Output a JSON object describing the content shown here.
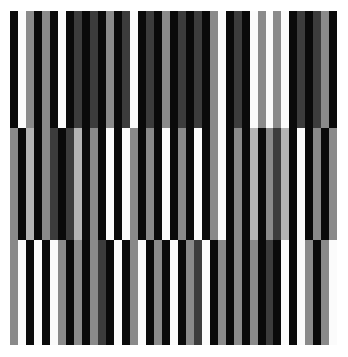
{
  "artwork": {
    "title": "Untitled Striped Composition",
    "medium": "geometric abstract op-art",
    "canvas": {
      "width_px": 348,
      "height_px": 357,
      "background_color": "#ffffff"
    },
    "artwork_area": {
      "left_px": 10,
      "top_px": 11,
      "width_px": 328,
      "height_px": 334
    }
  },
  "palette": {
    "black": "#0a0a0a",
    "white": "#fbfbfb",
    "light_gray": "#b4b4b4",
    "medium_gray": "#8a8a8a",
    "dark_gray": "#3c3c3c",
    "deep_gray": "#232323"
  },
  "chart_data": {
    "type": "heatmap",
    "subtitle": "Vertical stripes across three horizontal bands",
    "xlabel": "",
    "ylabel": "",
    "grid": false,
    "legend": "none",
    "stripe_count": 41,
    "band_count": 3,
    "band_heights_px": [
      117,
      112,
      105
    ],
    "stripe_widths_px": [
      8,
      8,
      8,
      8,
      8,
      8,
      8,
      8,
      8,
      8,
      8,
      8,
      8,
      8,
      8,
      8,
      8,
      8,
      8,
      8,
      8,
      8,
      8,
      8,
      8,
      8,
      8,
      8,
      8,
      8,
      8,
      8,
      8,
      8,
      8,
      8,
      8,
      8,
      8,
      8,
      8
    ],
    "bands": [
      {
        "name": "top-band",
        "y_range_px": [
          11,
          128
        ],
        "colors": [
          "#0a0a0a",
          "#fbfbfb",
          "#8a8a8a",
          "#0a0a0a",
          "#8a8a8a",
          "#0a0a0a",
          "#fbfbfb",
          "#0a0a0a",
          "#3c3c3c",
          "#0a0a0a",
          "#3c3c3c",
          "#0a0a0a",
          "#8a8a8a",
          "#0a0a0a",
          "#3c3c3c",
          "#fbfbfb",
          "#0a0a0a",
          "#3c3c3c",
          "#0a0a0a",
          "#8a8a8a",
          "#0a0a0a",
          "#3c3c3c",
          "#0a0a0a",
          "#3c3c3c",
          "#0a0a0a",
          "#8a8a8a",
          "#fbfbfb",
          "#0a0a0a",
          "#3c3c3c",
          "#0a0a0a",
          "#fbfbfb",
          "#8a8a8a",
          "#fbfbfb",
          "#8a8a8a",
          "#fbfbfb",
          "#0a0a0a",
          "#3c3c3c",
          "#0a0a0a",
          "#3c3c3c",
          "#8a8a8a",
          "#0a0a0a"
        ]
      },
      {
        "name": "middle-band",
        "y_range_px": [
          128,
          240
        ],
        "colors": [
          "#8a8a8a",
          "#0a0a0a",
          "#b4b4b4",
          "#0a0a0a",
          "#8a8a8a",
          "#3c3c3c",
          "#0a0a0a",
          "#3c3c3c",
          "#b4b4b4",
          "#0a0a0a",
          "#8a8a8a",
          "#0a0a0a",
          "#fbfbfb",
          "#0a0a0a",
          "#fbfbfb",
          "#8a8a8a",
          "#0a0a0a",
          "#8a8a8a",
          "#0a0a0a",
          "#fbfbfb",
          "#0a0a0a",
          "#8a8a8a",
          "#0a0a0a",
          "#fbfbfb",
          "#0a0a0a",
          "#8a8a8a",
          "#fbfbfb",
          "#0a0a0a",
          "#8a8a8a",
          "#0a0a0a",
          "#b4b4b4",
          "#0a0a0a",
          "#8a8a8a",
          "#3c3c3c",
          "#b4b4b4",
          "#0a0a0a",
          "#fbfbfb",
          "#0a0a0a",
          "#8a8a8a",
          "#0a0a0a",
          "#8a8a8a"
        ]
      },
      {
        "name": "bottom-band",
        "y_range_px": [
          240,
          345
        ],
        "colors": [
          "#8a8a8a",
          "#fbfbfb",
          "#0a0a0a",
          "#fbfbfb",
          "#0a0a0a",
          "#fbfbfb",
          "#8a8a8a",
          "#0a0a0a",
          "#8a8a8a",
          "#0a0a0a",
          "#8a8a8a",
          "#3c3c3c",
          "#0a0a0a",
          "#fbfbfb",
          "#0a0a0a",
          "#8a8a8a",
          "#fbfbfb",
          "#0a0a0a",
          "#8a8a8a",
          "#0a0a0a",
          "#fbfbfb",
          "#0a0a0a",
          "#8a8a8a",
          "#3c3c3c",
          "#fbfbfb",
          "#0a0a0a",
          "#8a8a8a",
          "#0a0a0a",
          "#8a8a8a",
          "#0a0a0a",
          "#8a8a8a",
          "#0a0a0a",
          "#3c3c3c",
          "#0a0a0a",
          "#fbfbfb",
          "#0a0a0a",
          "#fbfbfb",
          "#8a8a8a",
          "#0a0a0a",
          "#8a8a8a",
          "#fbfbfb"
        ]
      }
    ]
  }
}
